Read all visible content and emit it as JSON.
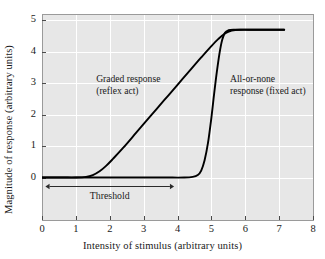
{
  "chart_data": {
    "type": "line",
    "title": "",
    "xlabel": "Intensity of stimulus (arbitrary units)",
    "ylabel": "Magnitude of response (arbitrary units)",
    "xlim": [
      0,
      8
    ],
    "ylim": [
      -1.35,
      5.2
    ],
    "xticks": [
      0,
      1,
      2,
      3,
      4,
      5,
      6,
      7,
      8
    ],
    "yticks": [
      0,
      1,
      2,
      3,
      4,
      5
    ],
    "grid": true,
    "legend": "none (curves labeled inline)",
    "plateau_value": 4.7,
    "series": [
      {
        "name": "Graded response (reflex act)",
        "color": "#000000",
        "points": [
          [
            0.0,
            0.0
          ],
          [
            0.6,
            0.0
          ],
          [
            1.0,
            0.0
          ],
          [
            1.3,
            0.02
          ],
          [
            1.5,
            0.08
          ],
          [
            1.7,
            0.2
          ],
          [
            1.9,
            0.38
          ],
          [
            2.1,
            0.6
          ],
          [
            2.4,
            0.95
          ],
          [
            2.8,
            1.45
          ],
          [
            3.2,
            1.95
          ],
          [
            3.6,
            2.45
          ],
          [
            4.0,
            2.95
          ],
          [
            4.4,
            3.45
          ],
          [
            4.7,
            3.82
          ],
          [
            5.0,
            4.18
          ],
          [
            5.2,
            4.4
          ],
          [
            5.4,
            4.58
          ],
          [
            5.6,
            4.67
          ],
          [
            5.85,
            4.7
          ],
          [
            6.3,
            4.7
          ],
          [
            7.15,
            4.7
          ]
        ]
      },
      {
        "name": "All-or-none response (fixed act)",
        "color": "#000000",
        "points": [
          [
            0.0,
            0.0
          ],
          [
            2.0,
            0.0
          ],
          [
            3.5,
            0.0
          ],
          [
            4.2,
            0.0
          ],
          [
            4.45,
            0.02
          ],
          [
            4.6,
            0.08
          ],
          [
            4.7,
            0.22
          ],
          [
            4.8,
            0.55
          ],
          [
            4.9,
            1.1
          ],
          [
            5.0,
            1.9
          ],
          [
            5.08,
            2.65
          ],
          [
            5.16,
            3.35
          ],
          [
            5.24,
            3.95
          ],
          [
            5.32,
            4.38
          ],
          [
            5.4,
            4.6
          ],
          [
            5.5,
            4.68
          ],
          [
            5.65,
            4.7
          ],
          [
            6.2,
            4.7
          ],
          [
            7.15,
            4.7
          ]
        ]
      }
    ],
    "annotations": [
      {
        "name": "graded-response-label",
        "lines": [
          "Graded response",
          "(reflex act)"
        ],
        "x": 1.6,
        "y": 3.0
      },
      {
        "name": "all-or-none-response-label",
        "lines": [
          "All-or-none",
          "response (fixed act)"
        ],
        "x": 5.55,
        "y": 3.0
      },
      {
        "name": "threshold-arrow-label",
        "label": "Threshold",
        "x_start": 0.1,
        "x_end": 3.9,
        "y": -0.27,
        "arrow": "double-headed"
      }
    ],
    "style": {
      "plot_background": "#e7e7e7",
      "gridline_color": "#ffffff",
      "frame_color": "#9a9a9a",
      "curve_color": "#000000",
      "text_color": "#1a1a1a",
      "figure_background": "#ffffff"
    }
  }
}
